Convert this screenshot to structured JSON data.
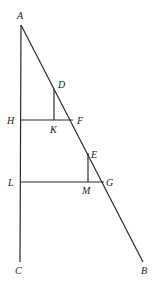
{
  "diagram": {
    "type": "geometric-figure",
    "colors": {
      "line": "#2a2a2a",
      "label": "#222222",
      "background": "#ffffff"
    },
    "points": {
      "A": {
        "label": "A",
        "x": 21,
        "y": 25
      },
      "C": {
        "label": "C",
        "x": 20,
        "y": 262
      },
      "B": {
        "label": "B",
        "x": 143,
        "y": 262
      },
      "D": {
        "label": "D",
        "x": 54,
        "y": 89
      },
      "H": {
        "label": "H",
        "x": 21,
        "y": 120
      },
      "K": {
        "label": "K",
        "x": 54,
        "y": 120
      },
      "F": {
        "label": "F",
        "x": 73,
        "y": 120
      },
      "E": {
        "label": "E",
        "x": 88,
        "y": 153
      },
      "L": {
        "label": "L",
        "x": 21,
        "y": 182
      },
      "M": {
        "label": "M",
        "x": 88,
        "y": 182
      },
      "G": {
        "label": "G",
        "x": 104,
        "y": 182
      }
    },
    "segments": [
      "AC",
      "AB",
      "HF",
      "DK",
      "LG",
      "EM"
    ],
    "labels": {
      "A": "A",
      "B": "B",
      "C": "C",
      "D": "D",
      "E": "E",
      "F": "F",
      "G": "G",
      "H": "H",
      "K": "K",
      "L": "L",
      "M": "M"
    }
  }
}
